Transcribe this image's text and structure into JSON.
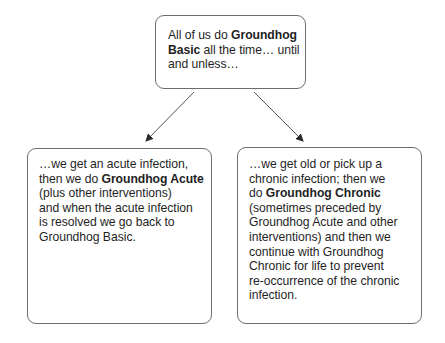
{
  "diagram": {
    "top_box": {
      "lines": [
        {
          "pre": "All of us do ",
          "bold": "Groundhog",
          "post": ""
        },
        {
          "pre": "",
          "bold": "Basic",
          "post": " all the time… until"
        },
        {
          "pre": "and unless…",
          "bold": "",
          "post": ""
        }
      ]
    },
    "left_box": {
      "lines": [
        {
          "pre": "…we get an acute infection,",
          "bold": "",
          "post": ""
        },
        {
          "pre": "then we do ",
          "bold": "Groundhog Acute",
          "post": ""
        },
        {
          "pre": "(plus other interventions)",
          "bold": "",
          "post": ""
        },
        {
          "pre": "and when the acute infection",
          "bold": "",
          "post": ""
        },
        {
          "pre": "is resolved we go back to",
          "bold": "",
          "post": ""
        },
        {
          "pre": "Groundhog Basic.",
          "bold": "",
          "post": ""
        }
      ]
    },
    "right_box": {
      "lines": [
        {
          "pre": "…we get old or pick up a",
          "bold": "",
          "post": ""
        },
        {
          "pre": "chronic infection; then we",
          "bold": "",
          "post": ""
        },
        {
          "pre": "do ",
          "bold": "Groundhog Chronic",
          "post": ""
        },
        {
          "pre": "(sometimes preceded by",
          "bold": "",
          "post": ""
        },
        {
          "pre": "Groundhog Acute and other",
          "bold": "",
          "post": ""
        },
        {
          "pre": "interventions) and then we",
          "bold": "",
          "post": ""
        },
        {
          "pre": "continue with Groundhog",
          "bold": "",
          "post": ""
        },
        {
          "pre": "Chronic for life to prevent",
          "bold": "",
          "post": ""
        },
        {
          "pre": "re-occurrence of the chronic",
          "bold": "",
          "post": ""
        },
        {
          "pre": "infection.",
          "bold": "",
          "post": ""
        }
      ]
    },
    "arrows": [
      {
        "from": "top_box",
        "to": "left_box"
      },
      {
        "from": "top_box",
        "to": "right_box"
      }
    ],
    "colors": {
      "border": "#6e6e6e",
      "text": "#1f1f1f",
      "arrow": "#555555"
    }
  }
}
